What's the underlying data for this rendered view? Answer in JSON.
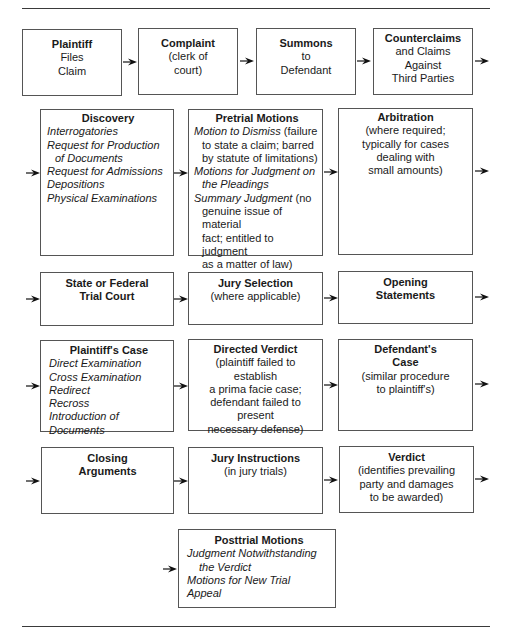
{
  "rows": [
    {
      "boxes": [
        {
          "title": "Plaintiff",
          "lines": [
            {
              "text": "Files"
            },
            {
              "text": "Claim"
            }
          ]
        },
        {
          "title": "Complaint",
          "lines": [
            {
              "text": "(clerk of"
            },
            {
              "text": "court)"
            }
          ]
        },
        {
          "title": "Summons",
          "lines": [
            {
              "text": "to"
            },
            {
              "text": "Defendant"
            }
          ]
        },
        {
          "title": "Counterclaims",
          "lines": [
            {
              "text": "and Claims"
            },
            {
              "text": "Against"
            },
            {
              "text": "Third Parties"
            }
          ]
        }
      ]
    },
    {
      "boxes": [
        {
          "title": "Discovery",
          "lines": [
            {
              "text": "Interrogatories",
              "italic": true
            },
            {
              "text": "Request for Production",
              "italic": true
            },
            {
              "text": "of Documents",
              "italic": true,
              "indent": true
            },
            {
              "text": "Request for Admissions",
              "italic": true
            },
            {
              "text": "Depositions",
              "italic": true
            },
            {
              "text": "Physical Examinations",
              "italic": true
            }
          ]
        },
        {
          "title": "Pretrial Motions",
          "lines": [
            {
              "italic_part": "Motion to Dismiss",
              "text": " (failure"
            },
            {
              "text": "to state a claim; barred",
              "indent": true
            },
            {
              "text": "by statute of limitations)",
              "indent": true
            },
            {
              "text": "Motions for Judgment on",
              "italic": true
            },
            {
              "text": "the Pleadings",
              "italic": true,
              "indent": true
            },
            {
              "italic_part": "Summary Judgment",
              "text": " (no"
            },
            {
              "text": "genuine issue of material",
              "indent": true
            },
            {
              "text": "fact; entitled to judgment",
              "indent": true
            },
            {
              "text": "as a matter of law)",
              "indent": true
            }
          ]
        },
        {
          "title": "Arbitration",
          "lines": [
            {
              "text": "(where required;"
            },
            {
              "text": "typically for cases"
            },
            {
              "text": "dealing with"
            },
            {
              "text": "small amounts)"
            }
          ]
        }
      ]
    },
    {
      "boxes": [
        {
          "title": "State or Federal",
          "title2": "Trial Court",
          "lines": []
        },
        {
          "title": "Jury Selection",
          "lines": [
            {
              "text": "(where applicable)"
            }
          ]
        },
        {
          "title": "Opening",
          "title2": "Statements",
          "lines": []
        }
      ]
    },
    {
      "boxes": [
        {
          "title": "Plaintiff's Case",
          "lines": [
            {
              "text": "Direct Examination",
              "italic": true
            },
            {
              "text": "Cross Examination",
              "italic": true
            },
            {
              "text": "Redirect",
              "italic": true
            },
            {
              "text": "Recross",
              "italic": true
            },
            {
              "text": "Introduction of Documents",
              "italic": true
            }
          ]
        },
        {
          "title": "Directed Verdict",
          "lines": [
            {
              "text": "(plaintiff failed to establish"
            },
            {
              "text": "a prima facie case;"
            },
            {
              "text": "defendant failed to present"
            },
            {
              "text": "necessary defense)"
            }
          ]
        },
        {
          "title": "Defendant's",
          "title2": "Case",
          "lines": [
            {
              "text": "(similar procedure"
            },
            {
              "text": "to plaintiff's)"
            }
          ]
        }
      ]
    },
    {
      "boxes": [
        {
          "title": "Closing",
          "title2": "Arguments",
          "lines": []
        },
        {
          "title": "Jury Instructions",
          "lines": [
            {
              "text": "(in jury trials)"
            }
          ]
        },
        {
          "title": "Verdict",
          "lines": [
            {
              "text": "(identifies prevailing"
            },
            {
              "text": "party and damages"
            },
            {
              "text": "to be awarded)"
            }
          ]
        }
      ]
    },
    {
      "boxes": [
        {
          "title": "Posttrial Motions",
          "lines": [
            {
              "text": "Judgment Notwithstanding",
              "italic": true
            },
            {
              "text": "the Verdict",
              "italic": true,
              "indent": true
            },
            {
              "text": "Motions for New Trial",
              "italic": true
            },
            {
              "text": "Appeal",
              "italic": true
            }
          ]
        }
      ]
    }
  ]
}
